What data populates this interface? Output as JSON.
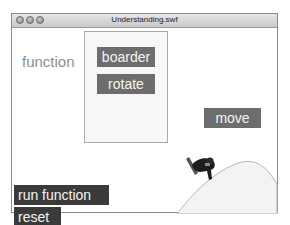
{
  "window": {
    "title": "Understanding.swf",
    "controls": [
      "close",
      "minimize",
      "zoom"
    ]
  },
  "stage": {
    "label": "function",
    "panel_buttons": [
      {
        "label": "boarder"
      },
      {
        "label": "rotate"
      }
    ],
    "move_button": {
      "label": "move"
    },
    "run_button": {
      "label": "run function"
    },
    "reset_button": {
      "label": "reset"
    },
    "graphic": "snowboarder-on-hill"
  },
  "colors": {
    "button_gray": "#6d6d6d",
    "button_dark": "#3a3a3a",
    "label_gray": "#8f8f8f"
  }
}
